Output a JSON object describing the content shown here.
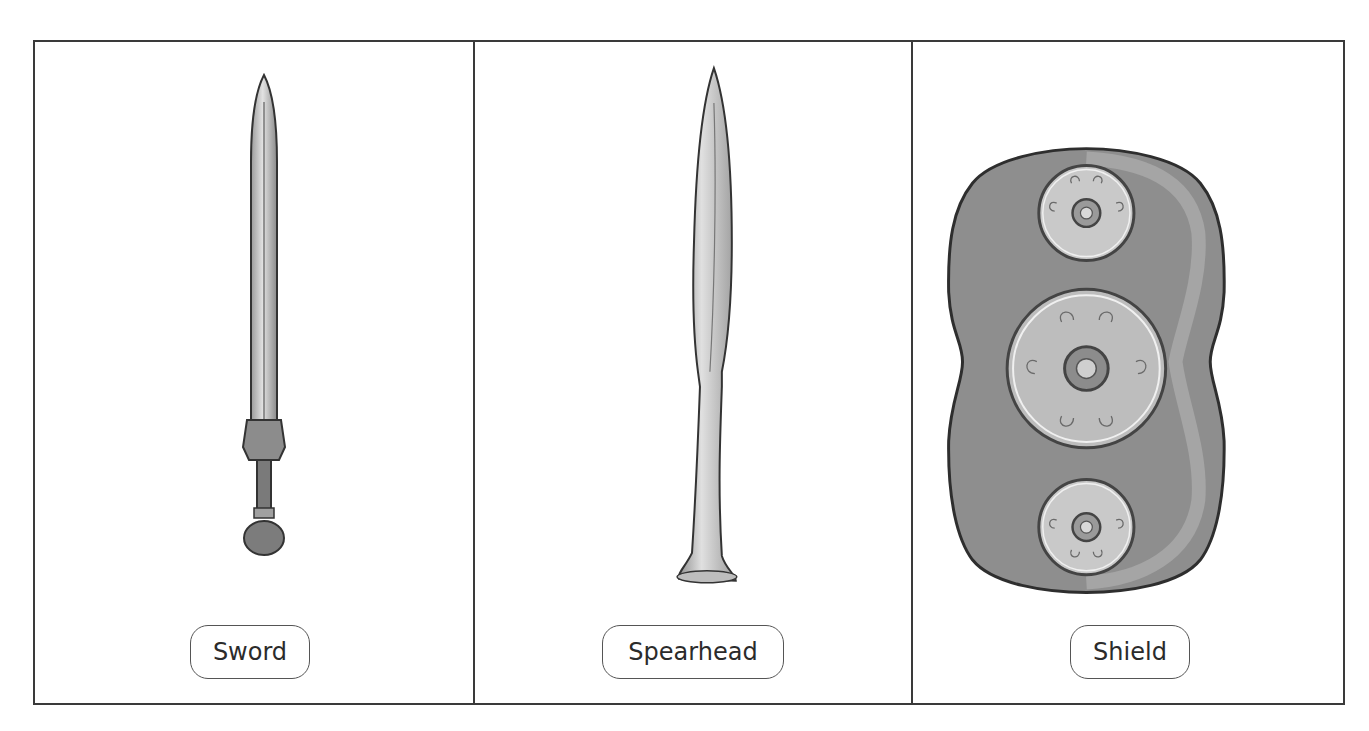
{
  "panels": [
    {
      "id": "sword",
      "label": "Sword",
      "illustration": "sword-icon"
    },
    {
      "id": "spearhead",
      "label": "Spearhead",
      "illustration": "spearhead-icon"
    },
    {
      "id": "shield",
      "label": "Shield",
      "illustration": "shield-icon"
    }
  ],
  "colors": {
    "border": "#3a3a3a",
    "metal_light": "#d6d6d6",
    "metal_mid": "#a9a9a9",
    "metal_dark": "#6f6f6f",
    "shield_body": "#8e8e8e"
  }
}
